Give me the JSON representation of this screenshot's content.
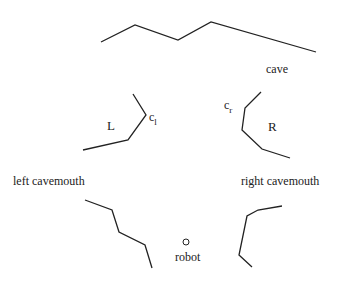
{
  "diagram": {
    "labels": {
      "cave": "cave",
      "L": "L",
      "R": "R",
      "c_l_base": "c",
      "c_l_sub": "l",
      "c_r_base": "c",
      "c_r_sub": "r",
      "left_cavemouth": "left  cavemouth",
      "right_cavemouth": "right  cavemouth",
      "robot": "robot"
    },
    "walls": {
      "cave_top": "101,42 135,25 178,40 211,22 316,52",
      "left_upper": "83,150 128,140 146,115 133,94",
      "right_upper": "261,92 245,108 242,130 262,149 290,158",
      "left_lower": "85,200 112,210 119,232 145,245 152,268",
      "right_lower": "282,206 258,210 247,216 239,255 252,267"
    },
    "robot_position": {
      "cx": "186",
      "cy": "242",
      "r": "3"
    },
    "stroke_color": "#222222"
  }
}
